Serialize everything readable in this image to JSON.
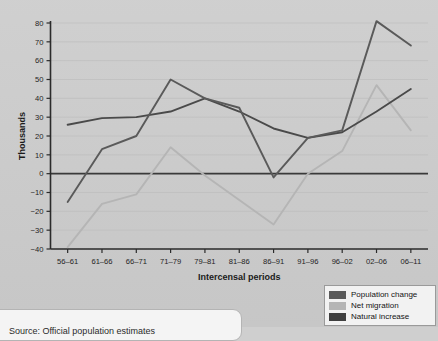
{
  "chart_data": {
    "type": "line",
    "title": "",
    "xlabel": "Intercensal periods",
    "ylabel": "Thousands",
    "categories": [
      "56–61",
      "61–66",
      "66–71",
      "71–79",
      "79–81",
      "81–86",
      "86–91",
      "91–96",
      "96–02",
      "02–06",
      "06–11"
    ],
    "ylim": [
      -40,
      80
    ],
    "yticks": [
      80,
      70,
      60,
      50,
      40,
      30,
      20,
      10,
      0,
      -10,
      -20,
      -30,
      -40
    ],
    "ytick_labels": [
      "80",
      "70",
      "60",
      "50",
      "40",
      "30",
      "20",
      "10",
      "0",
      "−10",
      "−20",
      "−30",
      "−40"
    ],
    "grid": true,
    "legend_position": "bottom-right",
    "series": [
      {
        "name": "Population change",
        "color": "#5a5a5a",
        "values": [
          -15,
          13,
          20,
          50,
          40,
          35,
          -2,
          19,
          23,
          81,
          68
        ]
      },
      {
        "name": "Net migration",
        "color": "#b5b5b5",
        "values": [
          -39,
          -16,
          -11,
          14,
          -1,
          -14,
          -27,
          0,
          12,
          47,
          23
        ]
      },
      {
        "name": "Natural increase",
        "color": "#4a4a4a",
        "values": [
          26,
          29.5,
          30,
          33,
          40,
          33,
          24,
          19,
          22,
          33,
          45
        ]
      }
    ]
  },
  "legend": {
    "items": [
      {
        "label": "Population change",
        "color": "#5a5a5a"
      },
      {
        "label": "Net migration",
        "color": "#b5b5b5"
      },
      {
        "label": "Natural increase",
        "color": "#3f3f3f"
      }
    ]
  },
  "caption": {
    "text": "Source: Official population estimates"
  },
  "colors": {
    "background": "#cdcdcd",
    "gridline": "#bdbdbd",
    "axis": "#2b2b2b",
    "zero_line": "#3a3a3a"
  }
}
